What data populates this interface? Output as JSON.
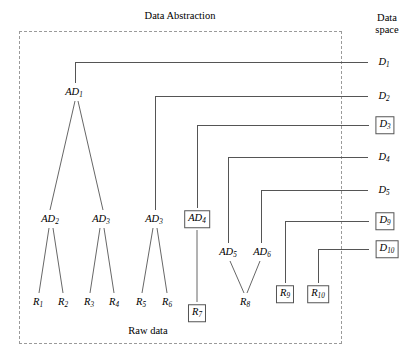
{
  "figure": {
    "title": "Data Abstraction",
    "raw_data_label": "Raw data",
    "data_space_label_line1": "Data",
    "data_space_label_line2": "space"
  },
  "colors": {
    "line": "#555555",
    "dashed_border": "#9a9a9a",
    "text": "#000000",
    "background": "#ffffff"
  },
  "abstraction_nodes": [
    {
      "id": "AD1",
      "name": "AD",
      "sub": "1",
      "x": 74,
      "y": 92,
      "boxed": false
    },
    {
      "id": "AD2",
      "name": "AD",
      "sub": "2",
      "x": 50,
      "y": 219,
      "boxed": false
    },
    {
      "id": "AD3",
      "name": "AD",
      "sub": "3",
      "x": 101,
      "y": 219,
      "boxed": false
    },
    {
      "id": "AD5t",
      "name": "AD",
      "sub": "3",
      "x": 154,
      "y": 219,
      "boxed": false
    },
    {
      "id": "AD4",
      "name": "AD",
      "sub": "4",
      "x": 197,
      "y": 219,
      "boxed": true
    },
    {
      "id": "AD5",
      "name": "AD",
      "sub": "5",
      "x": 228,
      "y": 252,
      "boxed": false
    },
    {
      "id": "AD6",
      "name": "AD",
      "sub": "6",
      "x": 262,
      "y": 252,
      "boxed": false
    }
  ],
  "raw_nodes": [
    {
      "id": "R1",
      "name": "R",
      "sub": "1",
      "x": 38,
      "y": 302,
      "boxed": false
    },
    {
      "id": "R2",
      "name": "R",
      "sub": "2",
      "x": 63,
      "y": 302,
      "boxed": false
    },
    {
      "id": "R3",
      "name": "R",
      "sub": "3",
      "x": 89,
      "y": 302,
      "boxed": false
    },
    {
      "id": "R4",
      "name": "R",
      "sub": "4",
      "x": 114,
      "y": 302,
      "boxed": false
    },
    {
      "id": "R5",
      "name": "R",
      "sub": "5",
      "x": 141,
      "y": 302,
      "boxed": false
    },
    {
      "id": "R6",
      "name": "R",
      "sub": "6",
      "x": 167,
      "y": 302,
      "boxed": false
    },
    {
      "id": "R7",
      "name": "R",
      "sub": "7",
      "x": 197,
      "y": 313,
      "boxed": true
    },
    {
      "id": "R8",
      "name": "R",
      "sub": "8",
      "x": 245,
      "y": 302,
      "boxed": false
    },
    {
      "id": "R9",
      "name": "R",
      "sub": "9",
      "x": 285,
      "y": 294,
      "boxed": true
    },
    {
      "id": "R10",
      "name": "R",
      "sub": "10",
      "x": 318,
      "y": 294,
      "boxed": true
    }
  ],
  "data_space_nodes": [
    {
      "id": "D1",
      "name": "D",
      "sub": "1",
      "x": 384,
      "y": 62,
      "boxed": false,
      "line_y": 62,
      "line_x1": 342,
      "line_x2": 368
    },
    {
      "id": "D2",
      "name": "D",
      "sub": "2",
      "x": 384,
      "y": 96,
      "boxed": false,
      "line_y": 96,
      "line_x1": 342,
      "line_x2": 368
    },
    {
      "id": "D3",
      "name": "D",
      "sub": "3",
      "x": 385,
      "y": 125,
      "boxed": true,
      "line_y": 125,
      "line_x1": 342,
      "line_x2": 369
    },
    {
      "id": "D4",
      "name": "D",
      "sub": "4",
      "x": 384,
      "y": 157,
      "boxed": false,
      "line_y": 157,
      "line_x1": 342,
      "line_x2": 368
    },
    {
      "id": "D5",
      "name": "D",
      "sub": "5",
      "x": 384,
      "y": 190,
      "boxed": false,
      "line_y": 190,
      "line_x1": 342,
      "line_x2": 368
    },
    {
      "id": "D9",
      "name": "D",
      "sub": "9",
      "x": 385,
      "y": 221,
      "boxed": true,
      "line_y": 221,
      "line_x1": 342,
      "line_x2": 369
    },
    {
      "id": "D10",
      "name": "D",
      "sub": "10",
      "x": 387,
      "y": 249,
      "boxed": true,
      "line_y": 249,
      "line_x1": 342,
      "line_x2": 369
    }
  ],
  "dashed_region": {
    "x": 19,
    "y": 31,
    "width": 323,
    "height": 313
  },
  "title_pos": {
    "x": 180,
    "y": 16
  },
  "raw_data_pos": {
    "x": 148,
    "y": 331
  },
  "data_space_pos": {
    "x": 387,
    "y": 24
  },
  "edges": {
    "tree": [
      {
        "from": "AD1",
        "to": "AD2",
        "x1": 75,
        "y1": 101,
        "x2": 50,
        "y2": 210
      },
      {
        "from": "AD1",
        "to": "AD3",
        "x1": 78,
        "y1": 101,
        "x2": 103,
        "y2": 210
      },
      {
        "from": "AD2",
        "to": "R1",
        "x1": 49,
        "y1": 228,
        "x2": 39,
        "y2": 293
      },
      {
        "from": "AD2",
        "to": "R2",
        "x1": 53,
        "y1": 228,
        "x2": 63,
        "y2": 293
      },
      {
        "from": "AD3",
        "to": "R3",
        "x1": 100,
        "y1": 228,
        "x2": 90,
        "y2": 293
      },
      {
        "from": "AD3",
        "to": "R4",
        "x1": 104,
        "y1": 228,
        "x2": 114,
        "y2": 293
      },
      {
        "from": "AD5t",
        "to": "R5",
        "x1": 153,
        "y1": 228,
        "x2": 142,
        "y2": 293
      },
      {
        "from": "AD5t",
        "to": "R6",
        "x1": 157,
        "y1": 228,
        "x2": 167,
        "y2": 293
      },
      {
        "from": "AD5",
        "to": "R8",
        "x1": 230,
        "y1": 261,
        "x2": 244,
        "y2": 293
      },
      {
        "from": "AD6",
        "to": "R8",
        "x1": 260,
        "y1": 261,
        "x2": 247,
        "y2": 293
      },
      {
        "from": "AD4",
        "to": "R7",
        "x1": 197,
        "y1": 230,
        "x2": 197,
        "y2": 302
      }
    ],
    "orthogonal": [
      {
        "from": "AD1",
        "to": "D1",
        "vx": 75,
        "vy_top": 62,
        "vy_bot": 83,
        "hx_end": 368
      },
      {
        "from": "AD5t",
        "to": "D2",
        "vx": 155,
        "vy_top": 96,
        "vy_bot": 210,
        "hx_end": 368
      },
      {
        "from": "AD4",
        "to": "D3",
        "vx": 197,
        "vy_top": 125,
        "vy_bot": 208,
        "hx_end": 369
      },
      {
        "from": "AD5",
        "to": "D4",
        "vx": 228,
        "vy_top": 157,
        "vy_bot": 243,
        "hx_end": 368
      },
      {
        "from": "AD6",
        "to": "D5",
        "vx": 261,
        "vy_top": 190,
        "vy_bot": 243,
        "hx_end": 368
      },
      {
        "from": "R9",
        "to": "D9",
        "vx": 285,
        "vy_top": 221,
        "vy_bot": 283,
        "hx_end": 369
      },
      {
        "from": "R10",
        "to": "D10",
        "vx": 318,
        "vy_top": 249,
        "vy_bot": 283,
        "hx_end": 369
      }
    ]
  }
}
